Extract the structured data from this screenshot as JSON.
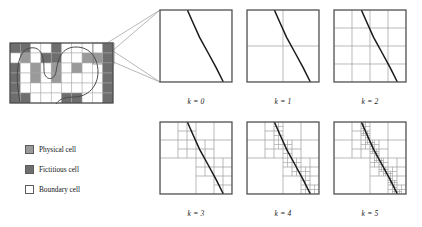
{
  "figure": {
    "background_color": "#ffffff"
  },
  "colors": {
    "physical_cell": "#9a9a9a",
    "fictitious_cell": "#6e6e6e",
    "boundary_cell": "#ffffff",
    "cell_border": "#5c5c5c",
    "grid_line": "#a8a8a8",
    "panel_border": "#555555",
    "interface_curve": "#1a1a1a",
    "connector_line": "#9a9a9a",
    "text": "#141414"
  },
  "legend": {
    "items": [
      {
        "label": "Physical cell",
        "swatch": "physical",
        "color": "#9a9a9a"
      },
      {
        "label": "Fictitious cell",
        "swatch": "fictitious",
        "color": "#6e6e6e"
      },
      {
        "label": "Boundary cell",
        "swatch": "boundary",
        "color": "#ffffff"
      }
    ]
  },
  "overview_grid": {
    "name": "coarse-background-grid",
    "cols": 10,
    "rows": 6,
    "cell_states": [
      [
        "fictitious",
        "fictitious",
        "boundary",
        "boundary",
        "fictitious",
        "boundary",
        "boundary",
        "boundary",
        "boundary",
        "fictitious"
      ],
      [
        "boundary",
        "physical",
        "boundary",
        "fictitious",
        "fictitious",
        "boundary",
        "boundary",
        "physical",
        "physical",
        "fictitious"
      ],
      [
        "fictitious",
        "boundary",
        "physical",
        "boundary",
        "physical",
        "boundary",
        "physical",
        "boundary",
        "boundary",
        "fictitious"
      ],
      [
        "fictitious",
        "boundary",
        "physical",
        "boundary",
        "physical",
        "boundary",
        "boundary",
        "boundary",
        "boundary",
        "fictitious"
      ],
      [
        "fictitious",
        "boundary",
        "boundary",
        "boundary",
        "boundary",
        "boundary",
        "boundary",
        "boundary",
        "boundary",
        "fictitious"
      ],
      [
        "fictitious",
        "fictitious",
        "boundary",
        "boundary",
        "boundary",
        "fictitious",
        "fictitious",
        "boundary",
        "boundary",
        "fictitious"
      ]
    ]
  },
  "panels": [
    {
      "id": "k0",
      "label": "k = 0",
      "level": 0,
      "subdivisions": 1,
      "refinement": "uniform"
    },
    {
      "id": "k1",
      "label": "k = 1",
      "level": 1,
      "subdivisions": 2,
      "refinement": "uniform"
    },
    {
      "id": "k2",
      "label": "k = 2",
      "level": 2,
      "subdivisions": 4,
      "refinement": "uniform"
    },
    {
      "id": "k3",
      "label": "k = 3",
      "level": 3,
      "subdivisions": 8,
      "refinement": "adaptive"
    },
    {
      "id": "k4",
      "label": "k = 4",
      "level": 4,
      "subdivisions": 16,
      "refinement": "adaptive"
    },
    {
      "id": "k5",
      "label": "k = 5",
      "level": 5,
      "subdivisions": 32,
      "refinement": "adaptive"
    }
  ],
  "chart_data": {
    "type": "diagram",
    "panel_labels": [
      "k = 0",
      "k = 1",
      "k = 2",
      "k = 3",
      "k = 4",
      "k = 5"
    ],
    "interface_curve_points": [
      [
        0.38,
        0.0
      ],
      [
        0.46,
        0.18
      ],
      [
        0.55,
        0.38
      ],
      [
        0.66,
        0.58
      ],
      [
        0.78,
        0.8
      ],
      [
        0.88,
        1.0
      ]
    ],
    "legend_entries": [
      "Physical cell",
      "Fictitious cell",
      "Boundary cell"
    ]
  }
}
